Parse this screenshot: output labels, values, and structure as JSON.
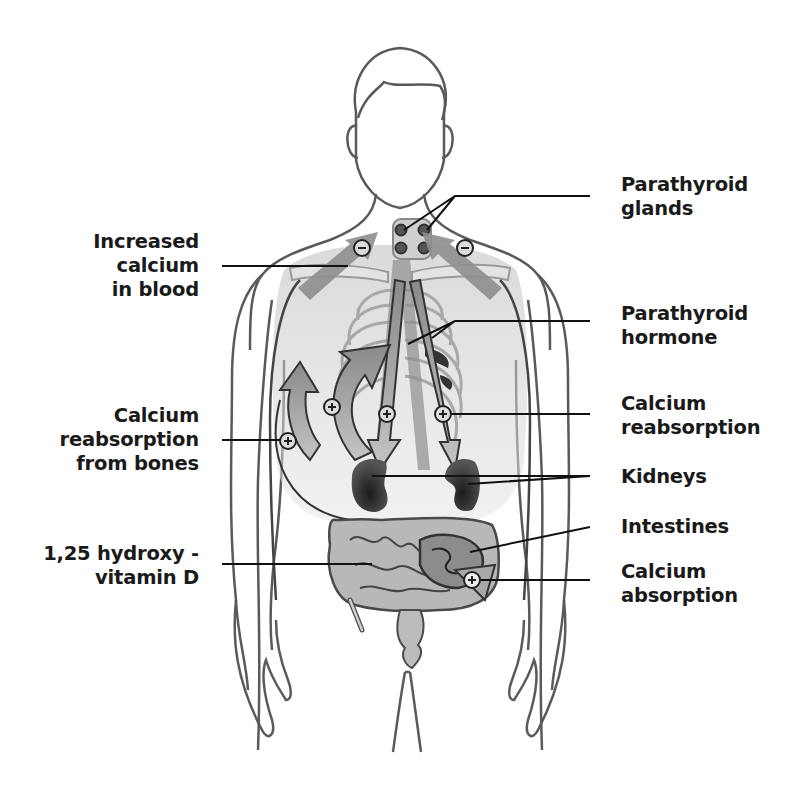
{
  "diagram": {
    "colors": {
      "outline": "#5a5a5a",
      "dark_organ": "#2a2a2a",
      "arrow_fill": "#9a9a9a",
      "leader_line": "#111111",
      "label_text": "#1a1a1a",
      "background": "#ffffff"
    },
    "labels": {
      "parathyroid_glands": {
        "line1": "Parathyroid",
        "line2": "glands"
      },
      "increased_calcium": {
        "line1": "Increased",
        "line2": "calcium",
        "line3": "in blood"
      },
      "parathyroid_hormone": {
        "line1": "Parathyroid",
        "line2": "hormone"
      },
      "calcium_reabsorption_bones": {
        "line1": "Calcium",
        "line2": "reabsorption",
        "line3": "from bones"
      },
      "calcium_reabsorption": {
        "line1": "Calcium",
        "line2": "reabsorption"
      },
      "kidneys": {
        "line1": "Kidneys"
      },
      "intestines": {
        "line1": "Intestines"
      },
      "vitamin_d": {
        "line1": "1,25 hydroxy -",
        "line2": "vitamin D"
      },
      "calcium_absorption": {
        "line1": "Calcium",
        "line2": "absorption"
      }
    },
    "markers": {
      "minus_symbol": "−",
      "plus_symbol": "+"
    }
  }
}
